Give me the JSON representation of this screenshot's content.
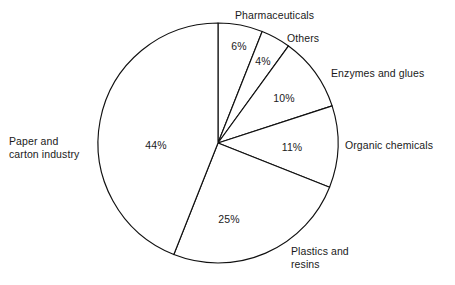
{
  "chart_data": {
    "type": "pie",
    "title": "",
    "subtitle": "",
    "xlabel": "",
    "ylabel": "",
    "grid": false,
    "legend": "none",
    "value_suffix": "%",
    "total": 100,
    "start_angle_deg": 0,
    "direction": "clockwise",
    "categories": [
      "Pharmaceuticals",
      "Others",
      "Enzymes and glues",
      "Organic chemicals",
      "Plastics and resins",
      "Paper and carton industry"
    ],
    "values": [
      6,
      4,
      10,
      11,
      25,
      44
    ],
    "value_labels": [
      "6%",
      "4%",
      "10%",
      "11%",
      "25%",
      "44%"
    ],
    "slices": [
      {
        "label": "Pharmaceuticals",
        "label_lines": "Pharmaceuticals",
        "value": 6,
        "value_label": "6%",
        "value_pos": {
          "x": 239,
          "y": 46
        },
        "label_pos": {
          "x": 235,
          "y": 15
        },
        "label_align": "left"
      },
      {
        "label": "Others",
        "label_lines": "Others",
        "value": 4,
        "value_label": "4%",
        "value_pos": {
          "x": 263,
          "y": 61
        },
        "label_pos": {
          "x": 287,
          "y": 38
        },
        "label_align": "left"
      },
      {
        "label": "Enzymes and glues",
        "label_lines": "Enzymes and glues",
        "value": 10,
        "value_label": "10%",
        "value_pos": {
          "x": 284,
          "y": 98
        },
        "label_pos": {
          "x": 331,
          "y": 73
        },
        "label_align": "left"
      },
      {
        "label": "Organic chemicals",
        "label_lines": "Organic chemicals",
        "value": 11,
        "value_label": "11%",
        "value_pos": {
          "x": 292,
          "y": 147
        },
        "label_pos": {
          "x": 345,
          "y": 145
        },
        "label_align": "left"
      },
      {
        "label": "Plastics and resins",
        "label_lines": "Plastics and\nresins",
        "value": 25,
        "value_label": "25%",
        "value_pos": {
          "x": 229,
          "y": 219
        },
        "label_pos": {
          "x": 291,
          "y": 257
        },
        "label_align": "left"
      },
      {
        "label": "Paper and carton industry",
        "label_lines": "Paper and\ncarton industry",
        "value": 44,
        "value_label": "44%",
        "value_pos": {
          "x": 156,
          "y": 145
        },
        "label_pos": {
          "x": 9,
          "y": 147
        },
        "label_align": "left"
      }
    ],
    "geometry": {
      "center_x": 218,
      "center_y": 143,
      "radius": 120
    },
    "colors": {
      "background": "#ffffff",
      "slice_fill": "#ffffff",
      "stroke": "#111111",
      "text": "#1a1a1a"
    }
  }
}
